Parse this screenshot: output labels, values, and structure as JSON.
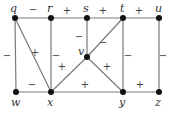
{
  "diagram": {
    "type": "signed-graph",
    "nodes": [
      {
        "id": "q",
        "label": "q",
        "x": 15,
        "y": 18,
        "lx": 10,
        "ly": 12
      },
      {
        "id": "r",
        "label": "r",
        "x": 51,
        "y": 18,
        "lx": 47,
        "ly": 12
      },
      {
        "id": "s",
        "label": "s",
        "x": 87,
        "y": 18,
        "lx": 83,
        "ly": 12
      },
      {
        "id": "t",
        "label": "t",
        "x": 123,
        "y": 18,
        "lx": 120,
        "ly": 12
      },
      {
        "id": "u",
        "label": "u",
        "x": 159,
        "y": 18,
        "lx": 155,
        "ly": 12
      },
      {
        "id": "v",
        "label": "v",
        "x": 87,
        "y": 57,
        "lx": 78,
        "ly": 55
      },
      {
        "id": "w",
        "label": "w",
        "x": 16,
        "y": 92,
        "lx": 11,
        "ly": 106
      },
      {
        "id": "x",
        "label": "x",
        "x": 51,
        "y": 92,
        "lx": 47,
        "ly": 106
      },
      {
        "id": "y",
        "label": "y",
        "x": 123,
        "y": 92,
        "lx": 119,
        "ly": 106
      },
      {
        "id": "z",
        "label": "z",
        "x": 159,
        "y": 92,
        "lx": 155,
        "ly": 106
      }
    ],
    "edges": [
      {
        "from": "q",
        "to": "r",
        "sign": "−",
        "sx": 33,
        "sy": 13
      },
      {
        "from": "r",
        "to": "s",
        "sign": "+",
        "sx": 67,
        "sy": 14
      },
      {
        "from": "s",
        "to": "t",
        "sign": "+",
        "sx": 103,
        "sy": 14
      },
      {
        "from": "t",
        "to": "u",
        "sign": "+",
        "sx": 139,
        "sy": 14
      },
      {
        "from": "q",
        "to": "w",
        "sign": "−",
        "sx": 7,
        "sy": 59
      },
      {
        "from": "q",
        "to": "x",
        "sign": "+",
        "sx": 35,
        "sy": 56
      },
      {
        "from": "r",
        "to": "x",
        "sign": "−",
        "sx": 56,
        "sy": 59
      },
      {
        "from": "s",
        "to": "v",
        "sign": "−",
        "sx": 79,
        "sy": 40
      },
      {
        "from": "t",
        "to": "v",
        "sign": "−",
        "sx": 103,
        "sy": 46
      },
      {
        "from": "x",
        "to": "v",
        "sign": "+",
        "sx": 62,
        "sy": 70
      },
      {
        "from": "v",
        "to": "y",
        "sign": "+",
        "sx": 107,
        "sy": 70
      },
      {
        "from": "t",
        "to": "y",
        "sign": "−",
        "sx": 128,
        "sy": 59
      },
      {
        "from": "u",
        "to": "z",
        "sign": "−",
        "sx": 163,
        "sy": 59
      },
      {
        "from": "w",
        "to": "x",
        "sign": "−",
        "sx": 32,
        "sy": 88
      },
      {
        "from": "x",
        "to": "y",
        "sign": "+",
        "sx": 85,
        "sy": 88
      },
      {
        "from": "y",
        "to": "z",
        "sign": "+",
        "sx": 140,
        "sy": 88
      }
    ]
  }
}
